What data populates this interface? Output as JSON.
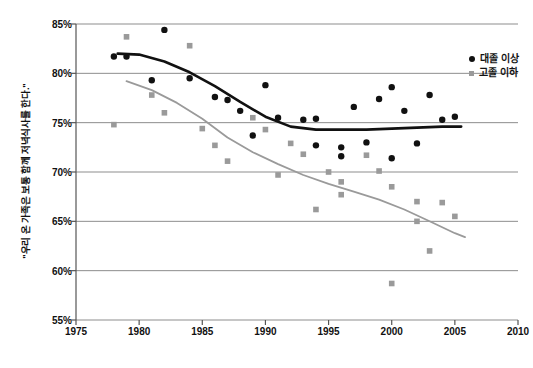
{
  "chart_data": {
    "type": "scatter",
    "title": "",
    "subtitle": "",
    "xlabel": "",
    "ylabel": "\"우리 온 가족은 보통 함께 저녁식사를 한다.\"",
    "xlim": [
      1975,
      2010
    ],
    "ylim": [
      55,
      85
    ],
    "xticks": [
      "1975",
      "1980",
      "1985",
      "1990",
      "1995",
      "2000",
      "2005",
      "2010"
    ],
    "xtick_values": [
      1975,
      1980,
      1985,
      1990,
      1995,
      2000,
      2005,
      2010
    ],
    "yticks": [
      "55%",
      "60%",
      "65%",
      "70%",
      "75%",
      "80%",
      "85%"
    ],
    "ytick_values": [
      55,
      60,
      65,
      70,
      75,
      80,
      85
    ],
    "grid": true,
    "legend_position": "top-right",
    "series": [
      {
        "name": "대졸 이상",
        "marker": "circle",
        "color": "#111111",
        "trend_color": "#111111",
        "points": [
          {
            "x": 1978,
            "y": 81.7
          },
          {
            "x": 1979,
            "y": 81.7
          },
          {
            "x": 1981,
            "y": 79.3
          },
          {
            "x": 1982,
            "y": 84.4
          },
          {
            "x": 1984,
            "y": 79.5
          },
          {
            "x": 1986,
            "y": 77.6
          },
          {
            "x": 1987,
            "y": 77.3
          },
          {
            "x": 1988,
            "y": 76.2
          },
          {
            "x": 1989,
            "y": 73.7
          },
          {
            "x": 1990,
            "y": 78.8
          },
          {
            "x": 1991,
            "y": 75.5
          },
          {
            "x": 1993,
            "y": 75.3
          },
          {
            "x": 1994,
            "y": 75.4
          },
          {
            "x": 1994,
            "y": 72.7
          },
          {
            "x": 1996,
            "y": 72.5
          },
          {
            "x": 1996,
            "y": 71.6
          },
          {
            "x": 1997,
            "y": 76.6
          },
          {
            "x": 1998,
            "y": 73.0
          },
          {
            "x": 1999,
            "y": 77.4
          },
          {
            "x": 2000,
            "y": 78.6
          },
          {
            "x": 2000,
            "y": 71.4
          },
          {
            "x": 2001,
            "y": 76.2
          },
          {
            "x": 2002,
            "y": 72.9
          },
          {
            "x": 2003,
            "y": 77.8
          },
          {
            "x": 2004,
            "y": 75.3
          },
          {
            "x": 2005,
            "y": 75.6
          }
        ],
        "trend": [
          {
            "x": 1978.3,
            "y": 82.0
          },
          {
            "x": 1980,
            "y": 81.9
          },
          {
            "x": 1982,
            "y": 81.2
          },
          {
            "x": 1984,
            "y": 80.1
          },
          {
            "x": 1986,
            "y": 78.7
          },
          {
            "x": 1988,
            "y": 77.1
          },
          {
            "x": 1990,
            "y": 75.6
          },
          {
            "x": 1992,
            "y": 74.6
          },
          {
            "x": 1994,
            "y": 74.3
          },
          {
            "x": 1996,
            "y": 74.3
          },
          {
            "x": 1998,
            "y": 74.3
          },
          {
            "x": 2000,
            "y": 74.4
          },
          {
            "x": 2002,
            "y": 74.5
          },
          {
            "x": 2004,
            "y": 74.6
          },
          {
            "x": 2005.5,
            "y": 74.6
          }
        ]
      },
      {
        "name": "고졸 이하",
        "marker": "square",
        "color": "#9a9a9a",
        "trend_color": "#9a9a9a",
        "points": [
          {
            "x": 1978,
            "y": 74.8
          },
          {
            "x": 1979,
            "y": 83.7
          },
          {
            "x": 1981,
            "y": 77.8
          },
          {
            "x": 1982,
            "y": 76.0
          },
          {
            "x": 1984,
            "y": 82.8
          },
          {
            "x": 1985,
            "y": 74.4
          },
          {
            "x": 1986,
            "y": 72.7
          },
          {
            "x": 1987,
            "y": 71.1
          },
          {
            "x": 1989,
            "y": 75.5
          },
          {
            "x": 1990,
            "y": 74.3
          },
          {
            "x": 1991,
            "y": 69.7
          },
          {
            "x": 1992,
            "y": 72.9
          },
          {
            "x": 1993,
            "y": 71.8
          },
          {
            "x": 1994,
            "y": 66.2
          },
          {
            "x": 1995,
            "y": 70.0
          },
          {
            "x": 1996,
            "y": 69.0
          },
          {
            "x": 1996,
            "y": 67.7
          },
          {
            "x": 1998,
            "y": 71.7
          },
          {
            "x": 1999,
            "y": 70.1
          },
          {
            "x": 2000,
            "y": 68.5
          },
          {
            "x": 2000,
            "y": 58.7
          },
          {
            "x": 2002,
            "y": 67.0
          },
          {
            "x": 2002,
            "y": 65.0
          },
          {
            "x": 2003,
            "y": 62.0
          },
          {
            "x": 2004,
            "y": 66.9
          },
          {
            "x": 2005,
            "y": 65.5
          }
        ],
        "trend": [
          {
            "x": 1979,
            "y": 79.2
          },
          {
            "x": 1981,
            "y": 78.3
          },
          {
            "x": 1983,
            "y": 77.0
          },
          {
            "x": 1985,
            "y": 75.4
          },
          {
            "x": 1987,
            "y": 73.5
          },
          {
            "x": 1989,
            "y": 72.0
          },
          {
            "x": 1991,
            "y": 70.8
          },
          {
            "x": 1993,
            "y": 69.7
          },
          {
            "x": 1995,
            "y": 68.8
          },
          {
            "x": 1997,
            "y": 68.0
          },
          {
            "x": 1999,
            "y": 67.2
          },
          {
            "x": 2001,
            "y": 66.2
          },
          {
            "x": 2003,
            "y": 65.0
          },
          {
            "x": 2005,
            "y": 63.8
          },
          {
            "x": 2005.8,
            "y": 63.4
          }
        ]
      }
    ]
  },
  "legend": {
    "items": [
      {
        "label": "대졸 이상",
        "marker": "circle-marker",
        "color": "#111111"
      },
      {
        "label": "고졸 이하",
        "marker": "square-marker",
        "color": "#9a9a9a"
      }
    ]
  },
  "axes": {
    "y_title": "\"우리 온 가족은 보통 함께 저녁식사를 한다.\""
  }
}
